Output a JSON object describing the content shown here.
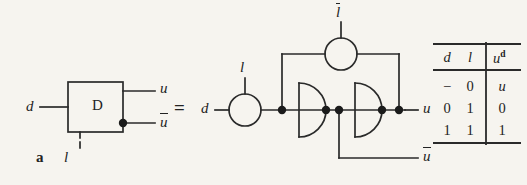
{
  "figure": {
    "panel_label": "a",
    "equals_sign": "=",
    "symbol_block": {
      "body_text": "D",
      "input_left_label": "d",
      "input_bottom_label": "l",
      "output_top_label": "u",
      "output_bottom_label": "ū",
      "output_bottom_base": "u"
    },
    "circuit": {
      "input_label": "d",
      "clock_label": "l",
      "clock_bar_label": "l̄",
      "clock_bar_base": "l",
      "output_label": "u",
      "output_bar_label": "ū",
      "output_bar_base": "u"
    },
    "truth_table": {
      "headers": [
        "d",
        "l",
        "u"
      ],
      "header_superscript": "d",
      "rows": [
        [
          "−",
          "0",
          "u"
        ],
        [
          "0",
          "1",
          "0"
        ],
        [
          "1",
          "1",
          "1"
        ]
      ]
    },
    "colors": {
      "background": "#f6f4ef",
      "ink": "#232323",
      "line": "#2a2a2a"
    }
  }
}
